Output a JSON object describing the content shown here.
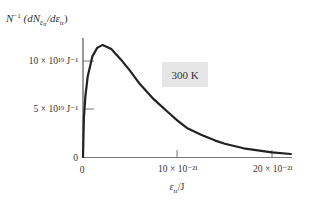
{
  "chart_data": {
    "type": "line",
    "title": "",
    "ylabel": "N⁻¹ (dN_εtr / dεtr)",
    "ylabel_parts": {
      "main": "N",
      "sup": "−1",
      "open": "(dN",
      "sub": "ε",
      "subsub": "tr",
      "mid": "/dε",
      "mid_sub": "tr",
      "close": ")"
    },
    "xlabel": "εtr/J",
    "xlabel_parts": {
      "main": "ε",
      "sub": "tr",
      "rest": "/J"
    },
    "x_unit_scale": "1e-21 J",
    "y_unit_scale": "1e19 J^-1",
    "xlim": [
      0,
      23
    ],
    "ylim": [
      0,
      12.5
    ],
    "x_ticks": [
      {
        "value": 0,
        "label": "0"
      },
      {
        "value": 10,
        "label": "10 × 10⁻²¹"
      },
      {
        "value": 20,
        "label": "20 × 10⁻²¹"
      }
    ],
    "y_ticks": [
      {
        "value": 0,
        "label": "0"
      },
      {
        "value": 5,
        "label": "5 × 10¹⁹ J⁻¹"
      },
      {
        "value": 10,
        "label": "10 × 10¹⁹ J⁻¹"
      }
    ],
    "annotation": "300 K",
    "grid": false,
    "legend": null,
    "series": [
      {
        "name": "300 K",
        "x": [
          0,
          0.1,
          0.25,
          0.5,
          1,
          1.5,
          2.07,
          3,
          4,
          5,
          6,
          7.5,
          9,
          10,
          11,
          12.5,
          14,
          15,
          17,
          20,
          22
        ],
        "values": [
          0,
          4.09,
          6.33,
          8.39,
          10.51,
          11.36,
          11.68,
          11.24,
          10.17,
          8.95,
          7.63,
          6.0,
          4.66,
          3.79,
          3.03,
          2.31,
          1.71,
          1.39,
          0.91,
          0.48,
          0.31
        ]
      }
    ]
  }
}
